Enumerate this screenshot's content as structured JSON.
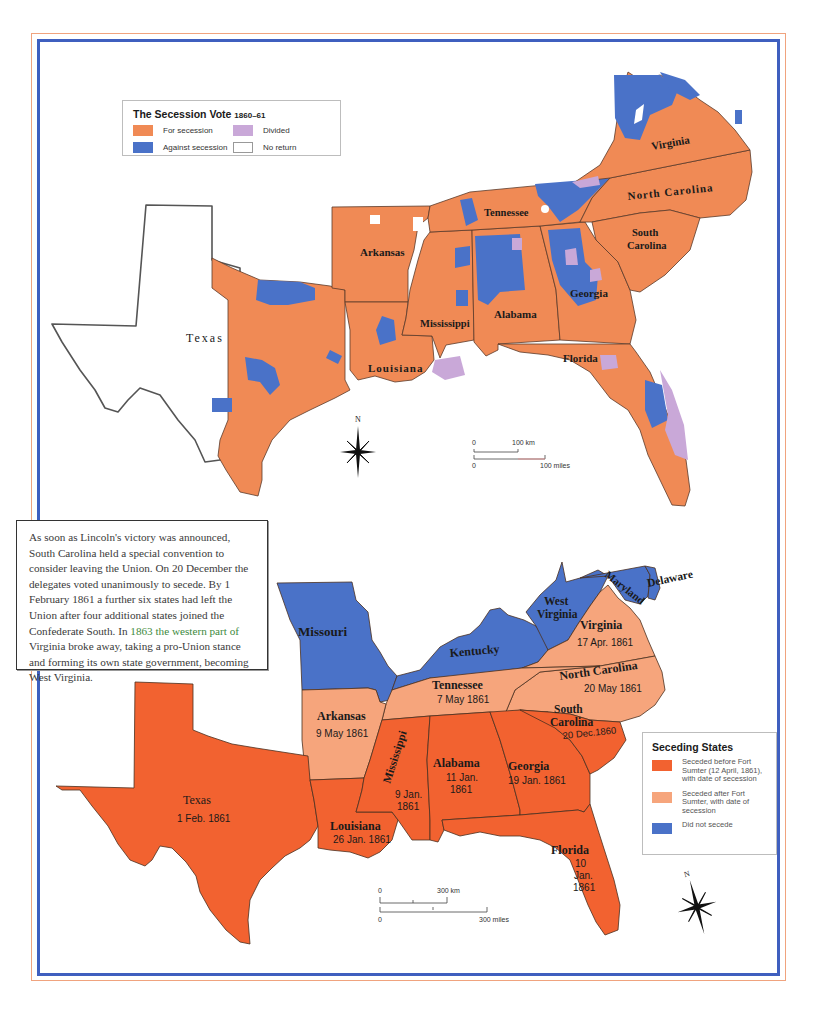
{
  "top_map": {
    "legend": {
      "title": "The Secession Vote",
      "years": "1860–61",
      "items": [
        {
          "label": "For secession",
          "color": "#f08a55"
        },
        {
          "label": "Divided",
          "color": "#c9a8d8"
        },
        {
          "label": "Against secession",
          "color": "#4a72c8"
        },
        {
          "label": "No return",
          "color": "#ffffff"
        }
      ]
    },
    "state_labels": {
      "texas": "Texas",
      "arkansas": "Arkansas",
      "louisiana": "Louisiana",
      "mississippi": "Mississippi",
      "alabama": "Alabama",
      "georgia": "Georgia",
      "florida": "Florida",
      "tennessee": "Tennessee",
      "virginia": "Virginia",
      "north_carolina": "North Carolina",
      "south_carolina_1": "South",
      "south_carolina_2": "Carolina"
    },
    "compass": {
      "north_label": "N"
    },
    "scale": {
      "km_zero": "0",
      "km_label": "100 km",
      "mi_zero": "0",
      "mi_label": "100 miles"
    }
  },
  "text_box": {
    "part1": "As soon as Lincoln's victory was announced, South Carolina held a special convention to consider leaving the Union. On 20 December the delegates voted unanimously to secede. By 1 February 1861 a further six states had left the Union after four additional states joined the Confederate South. In ",
    "highlight": "1863 the western part of",
    "part2": " Virginia broke away, taking a pro-Union stance and forming its own state government, becoming West Virginia."
  },
  "bottom_map": {
    "legend": {
      "title": "Seceding States",
      "items": [
        {
          "label": "Seceded before Fort Sumter (12 April, 1861), with date of secession",
          "color": "#f26230"
        },
        {
          "label": "Seceded after Fort Sumter, with date of secession",
          "color": "#f6a57c"
        },
        {
          "label": "Did not secede",
          "color": "#4a72c8"
        }
      ]
    },
    "states": {
      "missouri": {
        "name": "Missouri"
      },
      "kentucky": {
        "name": "Kentucky"
      },
      "west_virginia": {
        "name1": "West",
        "name2": "Virginia"
      },
      "maryland": {
        "name": "Maryland"
      },
      "delaware": {
        "name": "Delaware"
      },
      "virginia": {
        "name": "Virginia",
        "date": "17 Apr. 1861"
      },
      "north_carolina": {
        "name": "North Carolina",
        "date": "20 May 1861"
      },
      "tennessee": {
        "name": "Tennessee",
        "date": "7 May 1861"
      },
      "arkansas": {
        "name": "Arkansas",
        "date": "9 May 1861"
      },
      "south_carolina": {
        "name1": "South",
        "name2": "Carolina",
        "date": "20 Dec.1860"
      },
      "georgia": {
        "name": "Georgia",
        "date": "19 Jan. 1861"
      },
      "alabama": {
        "name": "Alabama",
        "date1": "11 Jan.",
        "date2": "1861"
      },
      "mississippi": {
        "name": "Mississippi",
        "date1": "9 Jan.",
        "date2": "1861"
      },
      "louisiana": {
        "name": "Louisiana",
        "date": "26 Jan. 1861"
      },
      "texas": {
        "name": "Texas",
        "date": "1 Feb. 1861"
      },
      "florida": {
        "name": "Florida",
        "date1": "10",
        "date2": "Jan.",
        "date3": "1861"
      }
    },
    "compass": {
      "north_label": "N"
    },
    "scale": {
      "km_zero": "0",
      "km_label": "300 km",
      "mi_zero": "0",
      "mi_label": "300 miles"
    }
  },
  "colors": {
    "frame_outer": "#f0a37e",
    "frame_inner": "#3f5fbf",
    "for_secession": "#f08a55",
    "against_secession": "#4a72c8",
    "divided": "#c9a8d8",
    "seceded_before": "#f26230",
    "seceded_after": "#f6a57c"
  }
}
